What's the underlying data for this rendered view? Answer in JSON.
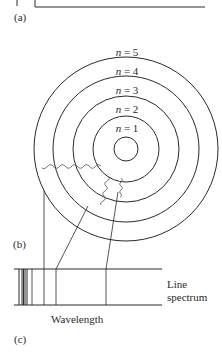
{
  "panels": {
    "a": {
      "label": "(a)"
    },
    "b": {
      "label": "(b)"
    },
    "c": {
      "label": "(c)"
    }
  },
  "orbits": [
    {
      "n": "1",
      "label_var": "n",
      "label_eq": " = 1"
    },
    {
      "n": "2",
      "label_var": "n",
      "label_eq": " = 2"
    },
    {
      "n": "3",
      "label_var": "n",
      "label_eq": " = 3"
    },
    {
      "n": "4",
      "label_var": "n",
      "label_eq": " = 4"
    },
    {
      "n": "5",
      "label_var": "n",
      "label_eq": " = 5"
    }
  ],
  "spectrum": {
    "label_line1": "Line",
    "label_line2": "spectrum",
    "axis_label": "Wavelength"
  },
  "colors": {
    "line": "#2a2a2a",
    "photon": "#555555",
    "background": "#ffffff"
  }
}
